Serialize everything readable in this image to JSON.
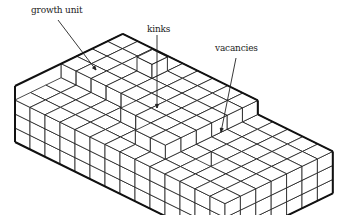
{
  "diagram": {
    "labels": {
      "growth_unit": "growth unit",
      "kinks": "kinks",
      "vacancies": "vacancies"
    },
    "colors": {
      "line": "#1a1a1a",
      "face": "#ffffff",
      "background": "#ffffff"
    }
  }
}
